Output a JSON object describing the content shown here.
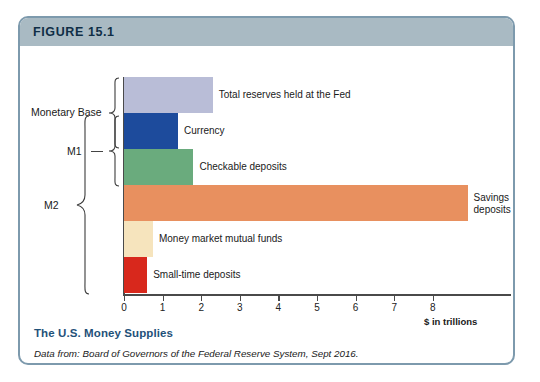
{
  "figure": {
    "header_label": "FIGURE 15.1",
    "caption_title": "The U.S. Money Supplies",
    "caption_source": "Data from: Board of Governors of the Federal Reserve System, Sept 2016.",
    "border_color": "#7d9aad",
    "header_color": "#a9bac3",
    "title_color": "#1f5179"
  },
  "chart_data": {
    "type": "bar",
    "orientation": "horizontal",
    "title": "The U.S. Money Supplies",
    "xlabel": "$ in trillions",
    "ylabel": "",
    "xlim": [
      0,
      8.8
    ],
    "grid": false,
    "legend": "none",
    "xticks": [
      0,
      1,
      2,
      3,
      4,
      5,
      6,
      7,
      8
    ],
    "xticklabels": [
      "0",
      "1",
      "2",
      "3",
      "4",
      "5",
      "6",
      "7",
      "8"
    ],
    "categories": [
      "Total reserves held at the Fed",
      "Currency",
      "Checkable deposits",
      "Savings deposits",
      "Money market mutual funds",
      "Small-time deposits"
    ],
    "values": [
      2.3,
      1.4,
      1.8,
      8.9,
      0.75,
      0.6
    ],
    "colors": [
      "#b9bdd7",
      "#1d4b9c",
      "#6aab7d",
      "#e8905f",
      "#f6e4bd",
      "#d8281c"
    ],
    "groups": [
      {
        "name": "Monetary Base",
        "members": [
          "Total reserves held at the Fed",
          "Currency"
        ]
      },
      {
        "name": "M1",
        "members": [
          "Currency",
          "Checkable deposits"
        ]
      },
      {
        "name": "M2",
        "members": [
          "Currency",
          "Checkable deposits",
          "Savings deposits",
          "Money market mutual funds",
          "Small-time deposits"
        ]
      }
    ]
  },
  "bars": [
    {
      "label": "Total reserves held at the Fed",
      "value": 2.3,
      "color": "#b9bdd7",
      "wrapped": false
    },
    {
      "label": "Currency",
      "value": 1.4,
      "color": "#1d4b9c",
      "wrapped": false
    },
    {
      "label": "Checkable deposits",
      "value": 1.8,
      "color": "#6aab7d",
      "wrapped": false
    },
    {
      "label": "Savings deposits",
      "value": 8.9,
      "color": "#e8905f",
      "wrapped": true
    },
    {
      "label": "Money market mutual funds",
      "value": 0.75,
      "color": "#f6e4bd",
      "wrapped": false
    },
    {
      "label": "Small-time deposits",
      "value": 0.6,
      "color": "#d8281c",
      "wrapped": false
    }
  ],
  "group_labels": {
    "monetary_base": "Monetary Base",
    "m1": "M1",
    "m2": "M2"
  },
  "axis": {
    "ticks": [
      "0",
      "1",
      "2",
      "3",
      "4",
      "5",
      "6",
      "7",
      "8"
    ],
    "unit_label": "$ in trillions"
  }
}
